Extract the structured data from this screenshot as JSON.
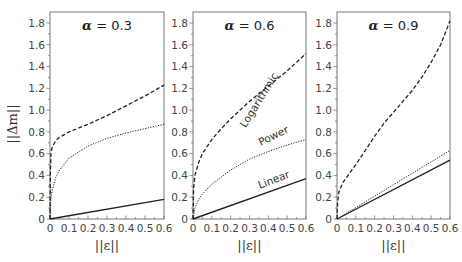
{
  "chart_data": {
    "type": "line",
    "ylabel": "||Δm||",
    "xlabel": "||ε||",
    "xlim": [
      0,
      0.6
    ],
    "ylim": [
      0,
      1.85
    ],
    "x_ticks": [
      "0",
      "0.1",
      "0.2",
      "0.3",
      "0.4",
      "0.5",
      "0.6"
    ],
    "y_ticks": [
      "0",
      "0.2",
      "0.4",
      "0.6",
      "0.8",
      "1.0",
      "1.2",
      "1.4",
      "1.6",
      "1.8"
    ],
    "series_styles": {
      "Logarithmic": "dashed",
      "Power": "dotted",
      "Linear": "solid"
    },
    "panels": [
      {
        "title": "α = 0.3",
        "alpha_symbol": "α",
        "alpha_value": "= 0.3",
        "series": [
          {
            "name": "Logarithmic",
            "x": [
              0,
              0.002,
              0.005,
              0.01,
              0.03,
              0.05,
              0.1,
              0.2,
              0.3,
              0.4,
              0.5,
              0.6
            ],
            "values": [
              0,
              0.45,
              0.6,
              0.65,
              0.72,
              0.75,
              0.8,
              0.87,
              0.95,
              1.04,
              1.13,
              1.23
            ]
          },
          {
            "name": "Power",
            "x": [
              0,
              0.005,
              0.01,
              0.03,
              0.05,
              0.1,
              0.2,
              0.3,
              0.4,
              0.5,
              0.6
            ],
            "values": [
              0,
              0.2,
              0.25,
              0.38,
              0.45,
              0.56,
              0.67,
              0.74,
              0.79,
              0.83,
              0.87
            ]
          },
          {
            "name": "Linear",
            "x": [
              0,
              0.6
            ],
            "values": [
              0,
              0.18
            ]
          }
        ],
        "labels": []
      },
      {
        "title": "α = 0.6",
        "alpha_symbol": "α",
        "alpha_value": "= 0.6",
        "series": [
          {
            "name": "Logarithmic",
            "x": [
              0,
              0.003,
              0.01,
              0.03,
              0.05,
              0.1,
              0.15,
              0.2,
              0.25,
              0.3,
              0.4,
              0.5,
              0.6
            ],
            "values": [
              0,
              0.28,
              0.4,
              0.52,
              0.6,
              0.73,
              0.83,
              0.92,
              1.0,
              1.08,
              1.22,
              1.36,
              1.52
            ]
          },
          {
            "name": "Power",
            "x": [
              0,
              0.01,
              0.03,
              0.05,
              0.1,
              0.2,
              0.3,
              0.4,
              0.5,
              0.6
            ],
            "values": [
              0,
              0.1,
              0.18,
              0.23,
              0.32,
              0.45,
              0.55,
              0.62,
              0.68,
              0.73
            ]
          },
          {
            "name": "Linear",
            "x": [
              0,
              0.6
            ],
            "values": [
              0,
              0.37
            ]
          }
        ],
        "labels": [
          {
            "text": "Logarithmic",
            "series": "Logarithmic"
          },
          {
            "text": "Power",
            "series": "Power"
          },
          {
            "text": "Linear",
            "series": "Linear"
          }
        ]
      },
      {
        "title": "α = 0.9",
        "alpha_symbol": "α",
        "alpha_value": "= 0.9",
        "series": [
          {
            "name": "Logarithmic",
            "x": [
              0,
              0.003,
              0.01,
              0.03,
              0.05,
              0.1,
              0.15,
              0.2,
              0.25,
              0.3,
              0.35,
              0.4,
              0.45,
              0.5,
              0.55,
              0.6
            ],
            "values": [
              0,
              0.15,
              0.25,
              0.33,
              0.38,
              0.5,
              0.63,
              0.76,
              0.88,
              0.98,
              1.08,
              1.18,
              1.3,
              1.44,
              1.6,
              1.82
            ]
          },
          {
            "name": "Power",
            "x": [
              0,
              0.6
            ],
            "values": [
              0,
              0.63
            ]
          },
          {
            "name": "Linear",
            "x": [
              0,
              0.6
            ],
            "values": [
              0,
              0.54
            ]
          }
        ],
        "labels": []
      }
    ]
  }
}
